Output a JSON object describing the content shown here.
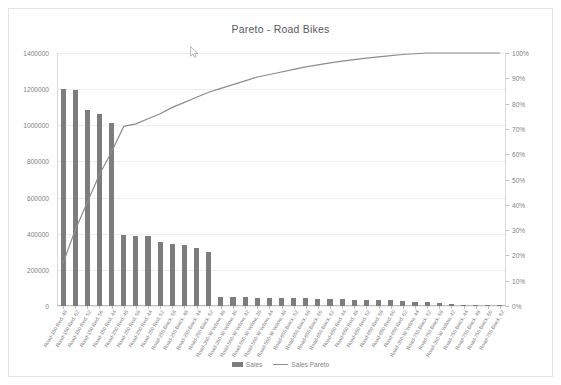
{
  "chart_data": {
    "type": "bar",
    "title": "Pareto - Road Bikes",
    "xlabel": "",
    "ylabel": "",
    "grid": true,
    "legend_position": "bottom",
    "ylim": [
      0,
      1400000
    ],
    "y2lim": [
      0,
      100
    ],
    "y_ticks": [
      "0",
      "200000",
      "400000",
      "600000",
      "800000",
      "1000000",
      "1200000",
      "1400000"
    ],
    "y2_ticks": [
      "0%",
      "10%",
      "20%",
      "30%",
      "40%",
      "50%",
      "60%",
      "70%",
      "80%",
      "90%",
      "100%"
    ],
    "categories": [
      "Road-150 Red, 48",
      "Road-150 Red, 62",
      "Road-150 Red, 52",
      "Road-150 Red, 56",
      "Road-150 Red, 44",
      "Road-250 Red, 48",
      "Road-250 Red, 58",
      "Road-250 Red, 44",
      "Road-250 Red, 52",
      "Road-250 Black, 58",
      "Road-250 Black, 48",
      "Road-250 Black, 44",
      "Road-250 Black, 52",
      "Road-350-W Yellow, 48",
      "Road-350-W Yellow, 40",
      "Road-550-W Yellow, 42",
      "Road-550-W Yellow, 38",
      "Road-550-W Yellow, 44",
      "Road-550-W Yellow, 48",
      "Road-650 Black, 52",
      "Road-650 Black, 58",
      "Road-650 Black, 60",
      "Road-650 Black, 62",
      "Road-650 Red, 44",
      "Road-650 Red, 48",
      "Road-650 Red, 52",
      "Road-650 Red, 58",
      "Road-650 Red, 60",
      "Road-650 Red, 62",
      "Road-350-W Yellow, 44",
      "Road-750 Black, 52",
      "Road-750 Black, 58",
      "Road-350-W Yellow, 42",
      "Road-750 Black, 44",
      "Road-750 Black, 48",
      "Road-750 Black, 60",
      "Road-750 Black, 62"
    ],
    "series": [
      {
        "name": "Sales",
        "type": "bar",
        "axis": "left",
        "color": "#7d7d7d",
        "values": [
          1200000,
          1198000,
          1082000,
          1060000,
          1012000,
          392000,
          390000,
          386000,
          352000,
          344000,
          336000,
          322000,
          300000,
          52000,
          50000,
          48000,
          46000,
          44000,
          44000,
          42000,
          42000,
          40000,
          40000,
          38000,
          36000,
          36000,
          34000,
          32000,
          30000,
          24000,
          20000,
          14000,
          9000,
          5000,
          3000,
          2000,
          1000
        ]
      },
      {
        "name": "Sales Pareto",
        "type": "line",
        "axis": "right",
        "color": "#8c8c8c",
        "values": [
          17.0,
          34.0,
          49.4,
          64.5,
          78.9,
          84.4,
          89.9,
          95.4,
          100.0,
          100.0,
          100.0,
          100.0,
          100.0,
          100.0,
          100.0,
          100.0,
          100.0,
          100.0,
          100.0,
          100.0,
          100.0,
          100.0,
          100.0,
          100.0,
          100.0,
          100.0,
          100.0,
          100.0,
          100.0,
          100.0,
          100.0,
          100.0,
          100.0,
          100.0,
          100.0,
          100.0,
          100.0
        ],
        "values_plotted": [
          17.0,
          30.0,
          41.0,
          52.0,
          61.0,
          71.0,
          72.0,
          74.0,
          76.0,
          78.5,
          80.5,
          82.5,
          84.5,
          86.0,
          87.5,
          89.0,
          90.5,
          91.5,
          92.5,
          93.5,
          94.5,
          95.3,
          96.1,
          96.8,
          97.4,
          98.0,
          98.5,
          99.0,
          99.4,
          99.7,
          100.0,
          100.0,
          100.0,
          100.0,
          100.0,
          100.0,
          100.0
        ]
      }
    ],
    "legend": [
      "Sales",
      "Sales Pareto"
    ]
  },
  "legend": {
    "sales_label": "Sales",
    "pareto_label": "Sales Pareto"
  },
  "colors": {
    "bar": "#7d7d7d",
    "line": "#8c8c8c",
    "grid": "#ededed",
    "text": "#7f7f7f",
    "frame": "#e3e3e3"
  },
  "cursor": {
    "icon": "mouse-pointer-icon"
  }
}
